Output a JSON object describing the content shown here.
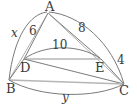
{
  "figure": {
    "type": "geometry-diagram",
    "vertices": [
      {
        "id": "A",
        "label": "A",
        "x": 48,
        "y": 12,
        "label_x": 45,
        "label_y": 11
      },
      {
        "id": "B",
        "label": "B",
        "x": 9,
        "y": 80,
        "label_x": 6,
        "label_y": 93
      },
      {
        "id": "C",
        "label": "C",
        "x": 124,
        "y": 84,
        "label_x": 120,
        "label_y": 95
      },
      {
        "id": "D",
        "label": "D",
        "x": 24,
        "y": 59,
        "label_x": 20,
        "label_y": 72
      },
      {
        "id": "E",
        "label": "E",
        "x": 101,
        "y": 59,
        "label_x": 96,
        "label_y": 72
      }
    ],
    "segments": [
      {
        "id": "AD",
        "from": "A",
        "to": "D",
        "label": "6",
        "label_x": 33,
        "label_y": 34,
        "style": "straight"
      },
      {
        "id": "AE",
        "from": "A",
        "to": "E",
        "label": "8",
        "label_x": 81,
        "label_y": 31,
        "style": "straight"
      },
      {
        "id": "DE",
        "from": "D",
        "to": "E",
        "label": "",
        "style": "straight-gray"
      },
      {
        "id": "DC",
        "from": "D",
        "to": "C",
        "label": "",
        "style": "straight"
      },
      {
        "id": "BD",
        "from": "B",
        "to": "D",
        "label": "",
        "style": "straight"
      },
      {
        "id": "BC",
        "from": "B",
        "to": "C",
        "label": "",
        "style": "straight-gray"
      },
      {
        "id": "EC",
        "from": "E",
        "to": "C",
        "label": "4",
        "label_x": 118,
        "label_y": 62,
        "style": "straight"
      }
    ],
    "arcs": [
      {
        "id": "arc-AB",
        "from": "A",
        "to": "B",
        "label": "x",
        "label_x": 14,
        "label_y": 36,
        "italic": true
      },
      {
        "id": "arc-AC",
        "from": "A",
        "to": "C",
        "label": "",
        "italic": false
      },
      {
        "id": "arc-DE",
        "from": "D",
        "to": "E",
        "label": "10",
        "label_x": 56,
        "label_y": 48,
        "italic": false
      },
      {
        "id": "arc-BC",
        "from": "B",
        "to": "C",
        "label": "y",
        "label_x": 64,
        "label_y": 100,
        "italic": true
      }
    ],
    "colors": {
      "stroke": "#7a7a7a",
      "stroke_light": "#b5b5b5",
      "text": "#3b3b3b",
      "background": "#ffffff"
    }
  }
}
